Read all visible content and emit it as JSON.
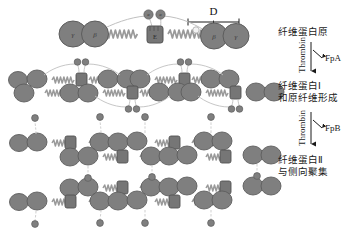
{
  "figure": {
    "title_alt": "Fibrinogen to fibrin polymerization cascade",
    "background_color": "#ffffff",
    "node_fill": "#7f7f7f",
    "node_stroke": "#5e5e5e",
    "coil_color": "#9a9a9a",
    "tether_color": "#b4b4b4",
    "text_color": "#1a1a1a"
  },
  "scale_bar": {
    "label": "D",
    "x_start": 188,
    "x_end": 239,
    "y": 22
  },
  "molecule_labels": {
    "gamma": "γ",
    "beta": "β",
    "alpha": "α",
    "e_domain": "E"
  },
  "stages": [
    {
      "id": "stage-1",
      "label_lines": [
        "纤维蛋白原"
      ],
      "label_x": 274,
      "label_y": 36
    },
    {
      "id": "stage-2",
      "label_lines": [
        "纤维蛋白Ⅰ",
        "和原纤维形成"
      ],
      "label_x": 274,
      "label_y": 89
    },
    {
      "id": "stage-3",
      "label_lines": [
        "纤维蛋白Ⅱ",
        "与侧向聚集"
      ],
      "label_x": 274,
      "label_y": 163
    }
  ],
  "transitions": [
    {
      "id": "transition-1",
      "enzyme": "Thrombin",
      "product": "FpA",
      "arrow_x": 311,
      "arrow_top": 42,
      "arrow_bottom": 75,
      "enzyme_x": 305,
      "enzyme_y": 72,
      "product_x": 327,
      "product_y": 60
    },
    {
      "id": "transition-2",
      "enzyme": "Thrombin",
      "product": "FpB",
      "arrow_x": 311,
      "arrow_top": 112,
      "arrow_bottom": 148,
      "enzyme_x": 305,
      "enzyme_y": 145,
      "product_x": 327,
      "product_y": 130
    }
  ]
}
